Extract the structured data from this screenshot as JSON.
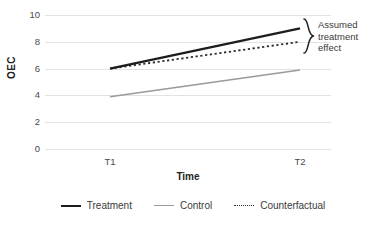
{
  "chart_data": {
    "type": "line",
    "title": "",
    "xlabel": "Time",
    "ylabel": "OEC",
    "x": [
      "T1",
      "T2"
    ],
    "categories": [
      "T1",
      "T2"
    ],
    "xticklabels": [
      "T1",
      "T2"
    ],
    "yticklabels": [
      "0",
      "2",
      "4",
      "6",
      "8",
      "10"
    ],
    "yticks": [
      0,
      2,
      4,
      6,
      8,
      10
    ],
    "ylim": [
      0,
      10
    ],
    "grid": "horizontal",
    "legend_position": "bottom",
    "series": [
      {
        "name": "Treatment",
        "values": [
          6.0,
          9.0
        ],
        "style": "solid",
        "color": "#1d1d1d",
        "width": 2.4
      },
      {
        "name": "Control",
        "values": [
          3.9,
          5.9
        ],
        "style": "solid",
        "color": "#9a9a9a",
        "width": 1.4
      },
      {
        "name": "Counterfactual",
        "values": [
          6.0,
          8.0
        ],
        "style": "dotted",
        "color": "#2b2b2b",
        "width": 1.8
      }
    ],
    "annotations": [
      {
        "type": "brace",
        "text": "Assumed treatment effect",
        "text_lines": [
          "Assumed",
          "treatment",
          "effect"
        ],
        "spans_series": [
          "Counterfactual",
          "Treatment"
        ],
        "span_values": [
          8.0,
          9.0
        ],
        "at_x": "T2"
      }
    ]
  },
  "axes": {
    "y_title": "OEC",
    "x_title": "Time",
    "y_ticks": [
      {
        "label": "10",
        "value": 10
      },
      {
        "label": "8",
        "value": 8
      },
      {
        "label": "6",
        "value": 6
      },
      {
        "label": "4",
        "value": 4
      },
      {
        "label": "2",
        "value": 2
      },
      {
        "label": "0",
        "value": 0
      }
    ],
    "x_ticks": [
      {
        "label": "T1"
      },
      {
        "label": "T2"
      }
    ]
  },
  "annotation": {
    "line1": "Assumed",
    "line2": "treatment",
    "line3": "effect"
  },
  "legend": {
    "items": [
      {
        "label": "Treatment",
        "color": "#1d1d1d",
        "style": "solid"
      },
      {
        "label": "Control",
        "color": "#9a9a9a",
        "style": "solid"
      },
      {
        "label": "Counterfactual",
        "color": "#2b2b2b",
        "style": "dotted"
      }
    ]
  },
  "colors": {
    "treatment": "#1d1d1d",
    "control": "#9a9a9a",
    "counterfactual": "#2b2b2b",
    "gridline": "#e2e2e2",
    "text": "#3a3a3a"
  }
}
